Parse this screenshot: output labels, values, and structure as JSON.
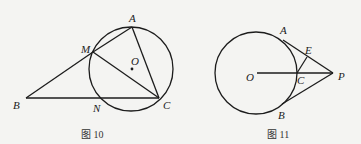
{
  "figures": [
    {
      "caption": "图 10",
      "circle": {
        "cx": 131,
        "cy": 69,
        "r": 42
      },
      "points": {
        "A": {
          "label": "A",
          "x": 132,
          "y": 27
        },
        "M": {
          "label": "M",
          "x": 93,
          "y": 52
        },
        "O": {
          "label": "O",
          "x": 132,
          "y": 69
        },
        "B": {
          "label": "B",
          "x": 26,
          "y": 98
        },
        "N": {
          "label": "N",
          "x": 100,
          "y": 98
        },
        "C": {
          "label": "C",
          "x": 159,
          "y": 98
        }
      },
      "segments": [
        "BM",
        "MA",
        "AC",
        "MC",
        "BC"
      ]
    },
    {
      "caption": "图 11",
      "circle": {
        "cx": 256,
        "cy": 73,
        "r": 41
      },
      "points": {
        "A": {
          "label": "A",
          "x": 283,
          "y": 40
        },
        "E": {
          "label": "E",
          "x": 307,
          "y": 57
        },
        "O": {
          "label": "O",
          "x": 257,
          "y": 73
        },
        "C": {
          "label": "C",
          "x": 297,
          "y": 73
        },
        "P": {
          "label": "P",
          "x": 333,
          "y": 73
        },
        "B": {
          "label": "B",
          "x": 282,
          "y": 104
        }
      },
      "segments": [
        "OP",
        "AP",
        "BP",
        "CE"
      ]
    }
  ]
}
